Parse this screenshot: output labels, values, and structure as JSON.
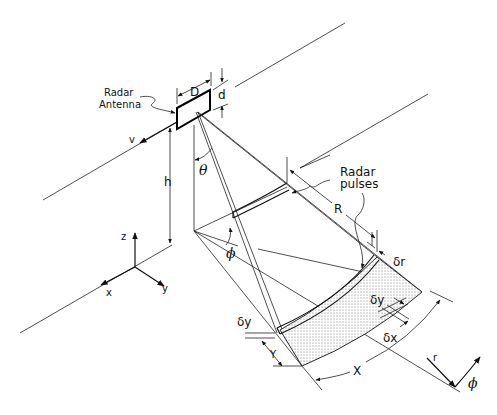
{
  "figure": {
    "type": "SAR imaging geometry diagram",
    "labels": {
      "antenna_title_line1": "Radar",
      "antenna_title_line2": "Antenna",
      "antenna_length": "D",
      "antenna_width": "d",
      "velocity": "v",
      "height": "h",
      "look_angle": "θ",
      "azimuth_angle_ground": "ϕ",
      "pulses_line1": "Radar",
      "pulses_line2": "pulses",
      "range": "R",
      "range_resolution": "δr",
      "ground_range_res_near": "δy",
      "ground_range_res_far": "δy",
      "azimuth_resolution": "δx",
      "swath_width": "Y",
      "swath_length": "X",
      "polar_r": "r",
      "polar_phi": "ϕ",
      "axis_z": "z",
      "axis_x": "x",
      "axis_y": "y"
    },
    "colors": {
      "line": "#111111",
      "swath_fill": "#cfcfcf",
      "background": "#ffffff"
    }
  }
}
